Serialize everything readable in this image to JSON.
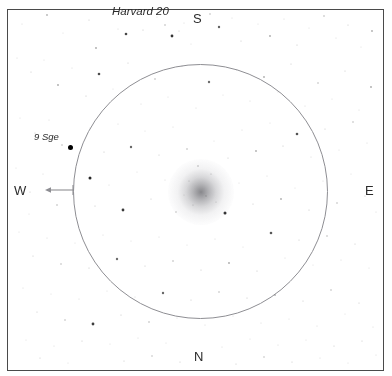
{
  "chart_data": {
    "type": "scatter",
    "title": "Harvard 20",
    "subtitle": "",
    "xlabel": "",
    "ylabel": "",
    "grid": false,
    "legend_position": "none",
    "field_circle": {
      "center_x": 201,
      "center_y": 191,
      "radius": 127
    },
    "cluster_glow": {
      "center_x": 201,
      "center_y": 192,
      "radius": 33
    },
    "annotations": [
      {
        "label": "Harvard 20",
        "x": 146,
        "y": 12,
        "style": "italic"
      },
      {
        "label": "9 Sge",
        "x": 50,
        "y": 136,
        "style": "italic"
      }
    ],
    "labeled_stars": [
      {
        "name": "9 Sge",
        "x": 70,
        "y": 147,
        "size": 5
      }
    ],
    "compass": [
      {
        "direction": "S",
        "x": 199,
        "y": 19
      },
      {
        "direction": "N",
        "x": 199,
        "y": 358
      },
      {
        "direction": "E",
        "x": 371,
        "y": 191
      },
      {
        "direction": "W",
        "x": 20,
        "y": 191,
        "arrow": true,
        "arrow_from_x": 73,
        "arrow_to_x": 45,
        "arrow_y": 190
      }
    ],
    "stars": [
      {
        "x": 22,
        "y": 24,
        "r": 0.5,
        "o": 0.18
      },
      {
        "x": 47,
        "y": 15,
        "r": 0.9,
        "o": 0.3
      },
      {
        "x": 63,
        "y": 33,
        "r": 0.5,
        "o": 0.16
      },
      {
        "x": 89,
        "y": 20,
        "r": 0.6,
        "o": 0.22
      },
      {
        "x": 96,
        "y": 48,
        "r": 0.9,
        "o": 0.35
      },
      {
        "x": 118,
        "y": 29,
        "r": 0.5,
        "o": 0.18
      },
      {
        "x": 126,
        "y": 34,
        "r": 1.3,
        "o": 0.72
      },
      {
        "x": 143,
        "y": 30,
        "r": 0.6,
        "o": 0.24
      },
      {
        "x": 157,
        "y": 17,
        "r": 0.5,
        "o": 0.16
      },
      {
        "x": 165,
        "y": 25,
        "r": 0.8,
        "o": 0.3
      },
      {
        "x": 172,
        "y": 36,
        "r": 1.4,
        "o": 0.8
      },
      {
        "x": 184,
        "y": 23,
        "r": 0.5,
        "o": 0.18
      },
      {
        "x": 179,
        "y": 31,
        "r": 0.6,
        "o": 0.22
      },
      {
        "x": 191,
        "y": 44,
        "r": 0.5,
        "o": 0.16
      },
      {
        "x": 210,
        "y": 14,
        "r": 0.8,
        "o": 0.28
      },
      {
        "x": 219,
        "y": 27,
        "r": 1.2,
        "o": 0.62
      },
      {
        "x": 232,
        "y": 18,
        "r": 0.5,
        "o": 0.18
      },
      {
        "x": 241,
        "y": 41,
        "r": 0.6,
        "o": 0.22
      },
      {
        "x": 258,
        "y": 24,
        "r": 0.5,
        "o": 0.16
      },
      {
        "x": 270,
        "y": 36,
        "r": 0.9,
        "o": 0.34
      },
      {
        "x": 284,
        "y": 19,
        "r": 0.5,
        "o": 0.18
      },
      {
        "x": 297,
        "y": 45,
        "r": 0.6,
        "o": 0.24
      },
      {
        "x": 309,
        "y": 28,
        "r": 0.5,
        "o": 0.16
      },
      {
        "x": 324,
        "y": 16,
        "r": 0.8,
        "o": 0.3
      },
      {
        "x": 336,
        "y": 38,
        "r": 0.5,
        "o": 0.18
      },
      {
        "x": 348,
        "y": 25,
        "r": 0.6,
        "o": 0.22
      },
      {
        "x": 361,
        "y": 47,
        "r": 0.5,
        "o": 0.16
      },
      {
        "x": 372,
        "y": 31,
        "r": 0.9,
        "o": 0.32
      },
      {
        "x": 17,
        "y": 58,
        "r": 0.5,
        "o": 0.18
      },
      {
        "x": 31,
        "y": 72,
        "r": 0.6,
        "o": 0.22
      },
      {
        "x": 44,
        "y": 60,
        "r": 0.5,
        "o": 0.16
      },
      {
        "x": 58,
        "y": 85,
        "r": 0.9,
        "o": 0.34
      },
      {
        "x": 72,
        "y": 68,
        "r": 0.5,
        "o": 0.18
      },
      {
        "x": 86,
        "y": 96,
        "r": 0.6,
        "o": 0.24
      },
      {
        "x": 99,
        "y": 74,
        "r": 1.3,
        "o": 0.7
      },
      {
        "x": 113,
        "y": 89,
        "r": 0.5,
        "o": 0.16
      },
      {
        "x": 128,
        "y": 63,
        "r": 0.6,
        "o": 0.22
      },
      {
        "x": 141,
        "y": 104,
        "r": 0.5,
        "o": 0.18
      },
      {
        "x": 155,
        "y": 79,
        "r": 0.8,
        "o": 0.3
      },
      {
        "x": 168,
        "y": 97,
        "r": 0.5,
        "o": 0.16
      },
      {
        "x": 182,
        "y": 66,
        "r": 0.6,
        "o": 0.22
      },
      {
        "x": 196,
        "y": 108,
        "r": 0.5,
        "o": 0.18
      },
      {
        "x": 209,
        "y": 82,
        "r": 1.2,
        "o": 0.58
      },
      {
        "x": 223,
        "y": 95,
        "r": 0.5,
        "o": 0.16
      },
      {
        "x": 237,
        "y": 70,
        "r": 0.6,
        "o": 0.24
      },
      {
        "x": 250,
        "y": 101,
        "r": 0.5,
        "o": 0.18
      },
      {
        "x": 264,
        "y": 77,
        "r": 0.9,
        "o": 0.32
      },
      {
        "x": 278,
        "y": 92,
        "r": 0.5,
        "o": 0.16
      },
      {
        "x": 291,
        "y": 64,
        "r": 0.6,
        "o": 0.22
      },
      {
        "x": 305,
        "y": 106,
        "r": 0.5,
        "o": 0.18
      },
      {
        "x": 318,
        "y": 83,
        "r": 0.8,
        "o": 0.28
      },
      {
        "x": 332,
        "y": 99,
        "r": 0.5,
        "o": 0.16
      },
      {
        "x": 345,
        "y": 71,
        "r": 0.6,
        "o": 0.22
      },
      {
        "x": 359,
        "y": 110,
        "r": 0.5,
        "o": 0.18
      },
      {
        "x": 371,
        "y": 87,
        "r": 0.9,
        "o": 0.34
      },
      {
        "x": 20,
        "y": 118,
        "r": 0.5,
        "o": 0.16
      },
      {
        "x": 35,
        "y": 133,
        "r": 0.6,
        "o": 0.22
      },
      {
        "x": 49,
        "y": 120,
        "r": 0.5,
        "o": 0.18
      },
      {
        "x": 62,
        "y": 145,
        "r": 0.8,
        "o": 0.28
      },
      {
        "x": 90,
        "y": 128,
        "r": 0.5,
        "o": 0.16
      },
      {
        "x": 104,
        "y": 152,
        "r": 0.6,
        "o": 0.24
      },
      {
        "x": 118,
        "y": 124,
        "r": 0.5,
        "o": 0.18
      },
      {
        "x": 131,
        "y": 147,
        "r": 1.2,
        "o": 0.6
      },
      {
        "x": 145,
        "y": 131,
        "r": 0.5,
        "o": 0.16
      },
      {
        "x": 159,
        "y": 155,
        "r": 0.6,
        "o": 0.22
      },
      {
        "x": 173,
        "y": 127,
        "r": 0.5,
        "o": 0.18
      },
      {
        "x": 187,
        "y": 149,
        "r": 0.8,
        "o": 0.3
      },
      {
        "x": 214,
        "y": 141,
        "r": 0.5,
        "o": 0.16
      },
      {
        "x": 228,
        "y": 158,
        "r": 0.6,
        "o": 0.22
      },
      {
        "x": 242,
        "y": 130,
        "r": 0.5,
        "o": 0.18
      },
      {
        "x": 256,
        "y": 151,
        "r": 0.9,
        "o": 0.32
      },
      {
        "x": 270,
        "y": 123,
        "r": 0.5,
        "o": 0.16
      },
      {
        "x": 283,
        "y": 146,
        "r": 0.6,
        "o": 0.24
      },
      {
        "x": 297,
        "y": 134,
        "r": 1.3,
        "o": 0.68
      },
      {
        "x": 311,
        "y": 157,
        "r": 0.5,
        "o": 0.18
      },
      {
        "x": 325,
        "y": 129,
        "r": 0.6,
        "o": 0.22
      },
      {
        "x": 339,
        "y": 150,
        "r": 0.5,
        "o": 0.16
      },
      {
        "x": 353,
        "y": 122,
        "r": 0.8,
        "o": 0.28
      },
      {
        "x": 367,
        "y": 143,
        "r": 0.5,
        "o": 0.18
      },
      {
        "x": 16,
        "y": 168,
        "r": 0.5,
        "o": 0.16
      },
      {
        "x": 30,
        "y": 192,
        "r": 0.6,
        "o": 0.22
      },
      {
        "x": 43,
        "y": 174,
        "r": 0.5,
        "o": 0.18
      },
      {
        "x": 57,
        "y": 205,
        "r": 0.8,
        "o": 0.3
      },
      {
        "x": 29,
        "y": 214,
        "r": 0.5,
        "o": 0.16
      },
      {
        "x": 90,
        "y": 178,
        "r": 1.5,
        "o": 0.85
      },
      {
        "x": 95,
        "y": 206,
        "r": 0.6,
        "o": 0.24
      },
      {
        "x": 109,
        "y": 185,
        "r": 0.5,
        "o": 0.18
      },
      {
        "x": 123,
        "y": 210,
        "r": 1.4,
        "o": 0.78
      },
      {
        "x": 137,
        "y": 172,
        "r": 0.5,
        "o": 0.16
      },
      {
        "x": 151,
        "y": 199,
        "r": 0.6,
        "o": 0.22
      },
      {
        "x": 165,
        "y": 180,
        "r": 0.5,
        "o": 0.18
      },
      {
        "x": 176,
        "y": 212,
        "r": 0.8,
        "o": 0.28
      },
      {
        "x": 225,
        "y": 213,
        "r": 1.5,
        "o": 0.86
      },
      {
        "x": 239,
        "y": 183,
        "r": 0.5,
        "o": 0.16
      },
      {
        "x": 253,
        "y": 204,
        "r": 0.6,
        "o": 0.22
      },
      {
        "x": 267,
        "y": 176,
        "r": 0.5,
        "o": 0.18
      },
      {
        "x": 281,
        "y": 199,
        "r": 0.9,
        "o": 0.32
      },
      {
        "x": 295,
        "y": 188,
        "r": 0.5,
        "o": 0.16
      },
      {
        "x": 309,
        "y": 210,
        "r": 0.6,
        "o": 0.24
      },
      {
        "x": 323,
        "y": 181,
        "r": 0.5,
        "o": 0.18
      },
      {
        "x": 337,
        "y": 203,
        "r": 0.8,
        "o": 0.28
      },
      {
        "x": 351,
        "y": 174,
        "r": 0.5,
        "o": 0.16
      },
      {
        "x": 365,
        "y": 196,
        "r": 0.6,
        "o": 0.22
      },
      {
        "x": 376,
        "y": 212,
        "r": 0.5,
        "o": 0.18
      },
      {
        "x": 19,
        "y": 232,
        "r": 0.5,
        "o": 0.16
      },
      {
        "x": 33,
        "y": 256,
        "r": 0.6,
        "o": 0.22
      },
      {
        "x": 47,
        "y": 238,
        "r": 0.5,
        "o": 0.18
      },
      {
        "x": 61,
        "y": 264,
        "r": 0.8,
        "o": 0.28
      },
      {
        "x": 75,
        "y": 243,
        "r": 0.5,
        "o": 0.16
      },
      {
        "x": 89,
        "y": 268,
        "r": 0.6,
        "o": 0.24
      },
      {
        "x": 103,
        "y": 235,
        "r": 0.5,
        "o": 0.18
      },
      {
        "x": 117,
        "y": 259,
        "r": 1.2,
        "o": 0.58
      },
      {
        "x": 131,
        "y": 241,
        "r": 0.5,
        "o": 0.16
      },
      {
        "x": 145,
        "y": 266,
        "r": 0.6,
        "o": 0.22
      },
      {
        "x": 159,
        "y": 237,
        "r": 0.5,
        "o": 0.18
      },
      {
        "x": 173,
        "y": 261,
        "r": 0.8,
        "o": 0.3
      },
      {
        "x": 187,
        "y": 245,
        "r": 0.5,
        "o": 0.16
      },
      {
        "x": 201,
        "y": 270,
        "r": 0.6,
        "o": 0.22
      },
      {
        "x": 215,
        "y": 239,
        "r": 0.5,
        "o": 0.18
      },
      {
        "x": 229,
        "y": 263,
        "r": 0.9,
        "o": 0.34
      },
      {
        "x": 243,
        "y": 247,
        "r": 0.5,
        "o": 0.16
      },
      {
        "x": 257,
        "y": 271,
        "r": 0.6,
        "o": 0.24
      },
      {
        "x": 271,
        "y": 233,
        "r": 1.3,
        "o": 0.66
      },
      {
        "x": 285,
        "y": 258,
        "r": 0.5,
        "o": 0.18
      },
      {
        "x": 299,
        "y": 240,
        "r": 0.6,
        "o": 0.22
      },
      {
        "x": 313,
        "y": 265,
        "r": 0.5,
        "o": 0.16
      },
      {
        "x": 327,
        "y": 236,
        "r": 0.8,
        "o": 0.28
      },
      {
        "x": 341,
        "y": 260,
        "r": 0.5,
        "o": 0.18
      },
      {
        "x": 355,
        "y": 244,
        "r": 0.6,
        "o": 0.22
      },
      {
        "x": 369,
        "y": 268,
        "r": 0.5,
        "o": 0.16
      },
      {
        "x": 23,
        "y": 288,
        "r": 0.5,
        "o": 0.18
      },
      {
        "x": 37,
        "y": 312,
        "r": 0.6,
        "o": 0.22
      },
      {
        "x": 51,
        "y": 294,
        "r": 0.5,
        "o": 0.16
      },
      {
        "x": 65,
        "y": 320,
        "r": 0.8,
        "o": 0.28
      },
      {
        "x": 79,
        "y": 299,
        "r": 0.5,
        "o": 0.18
      },
      {
        "x": 93,
        "y": 324,
        "r": 1.4,
        "o": 0.76
      },
      {
        "x": 107,
        "y": 291,
        "r": 0.5,
        "o": 0.16
      },
      {
        "x": 121,
        "y": 315,
        "r": 0.6,
        "o": 0.24
      },
      {
        "x": 135,
        "y": 297,
        "r": 0.5,
        "o": 0.18
      },
      {
        "x": 149,
        "y": 322,
        "r": 0.8,
        "o": 0.3
      },
      {
        "x": 163,
        "y": 293,
        "r": 1.2,
        "o": 0.6
      },
      {
        "x": 177,
        "y": 318,
        "r": 0.5,
        "o": 0.16
      },
      {
        "x": 191,
        "y": 300,
        "r": 0.6,
        "o": 0.22
      },
      {
        "x": 205,
        "y": 325,
        "r": 0.5,
        "o": 0.18
      },
      {
        "x": 219,
        "y": 292,
        "r": 0.8,
        "o": 0.28
      },
      {
        "x": 233,
        "y": 316,
        "r": 0.5,
        "o": 0.16
      },
      {
        "x": 247,
        "y": 298,
        "r": 0.6,
        "o": 0.24
      },
      {
        "x": 261,
        "y": 323,
        "r": 0.5,
        "o": 0.18
      },
      {
        "x": 275,
        "y": 295,
        "r": 0.9,
        "o": 0.32
      },
      {
        "x": 289,
        "y": 319,
        "r": 0.5,
        "o": 0.16
      },
      {
        "x": 303,
        "y": 301,
        "r": 0.6,
        "o": 0.22
      },
      {
        "x": 317,
        "y": 326,
        "r": 0.5,
        "o": 0.18
      },
      {
        "x": 331,
        "y": 290,
        "r": 0.8,
        "o": 0.28
      },
      {
        "x": 345,
        "y": 314,
        "r": 0.5,
        "o": 0.16
      },
      {
        "x": 359,
        "y": 303,
        "r": 0.6,
        "o": 0.22
      },
      {
        "x": 373,
        "y": 327,
        "r": 0.5,
        "o": 0.18
      },
      {
        "x": 26,
        "y": 340,
        "r": 0.5,
        "o": 0.16
      },
      {
        "x": 40,
        "y": 358,
        "r": 0.6,
        "o": 0.22
      },
      {
        "x": 54,
        "y": 346,
        "r": 0.5,
        "o": 0.18
      },
      {
        "x": 68,
        "y": 363,
        "r": 0.5,
        "o": 0.16
      },
      {
        "x": 82,
        "y": 341,
        "r": 0.6,
        "o": 0.22
      },
      {
        "x": 110,
        "y": 344,
        "r": 0.5,
        "o": 0.16
      },
      {
        "x": 124,
        "y": 361,
        "r": 0.6,
        "o": 0.22
      },
      {
        "x": 138,
        "y": 338,
        "r": 0.5,
        "o": 0.18
      },
      {
        "x": 152,
        "y": 356,
        "r": 0.8,
        "o": 0.26
      },
      {
        "x": 166,
        "y": 343,
        "r": 0.5,
        "o": 0.16
      },
      {
        "x": 180,
        "y": 362,
        "r": 0.6,
        "o": 0.22
      },
      {
        "x": 222,
        "y": 347,
        "r": 0.5,
        "o": 0.18
      },
      {
        "x": 236,
        "y": 364,
        "r": 0.6,
        "o": 0.22
      },
      {
        "x": 250,
        "y": 339,
        "r": 0.5,
        "o": 0.16
      },
      {
        "x": 264,
        "y": 357,
        "r": 0.8,
        "o": 0.26
      },
      {
        "x": 278,
        "y": 345,
        "r": 0.5,
        "o": 0.18
      },
      {
        "x": 292,
        "y": 362,
        "r": 0.6,
        "o": 0.22
      },
      {
        "x": 306,
        "y": 340,
        "r": 0.5,
        "o": 0.16
      },
      {
        "x": 320,
        "y": 358,
        "r": 0.5,
        "o": 0.18
      },
      {
        "x": 334,
        "y": 346,
        "r": 0.6,
        "o": 0.22
      },
      {
        "x": 348,
        "y": 363,
        "r": 0.5,
        "o": 0.16
      },
      {
        "x": 362,
        "y": 341,
        "r": 0.6,
        "o": 0.22
      },
      {
        "x": 376,
        "y": 355,
        "r": 0.5,
        "o": 0.18
      },
      {
        "x": 198,
        "y": 166,
        "r": 0.7,
        "o": 0.4
      },
      {
        "x": 211,
        "y": 174,
        "r": 0.6,
        "o": 0.34
      },
      {
        "x": 189,
        "y": 181,
        "r": 0.6,
        "o": 0.3
      },
      {
        "x": 206,
        "y": 196,
        "r": 0.7,
        "o": 0.38
      },
      {
        "x": 193,
        "y": 205,
        "r": 0.6,
        "o": 0.32
      },
      {
        "x": 216,
        "y": 202,
        "r": 0.6,
        "o": 0.28
      },
      {
        "x": 184,
        "y": 195,
        "r": 0.5,
        "o": 0.26
      }
    ]
  },
  "chart": {
    "title": "Harvard 20",
    "star_label": "9 Sge",
    "compass_s": "S",
    "compass_n": "N",
    "compass_e": "E",
    "compass_w": "W"
  },
  "colors": {
    "background": "#ffffff",
    "frame": "#4a4a4a",
    "circle": "#8e8e93",
    "star": "#000000",
    "text": "#2b2b2b",
    "glow": "#6b6b70"
  }
}
